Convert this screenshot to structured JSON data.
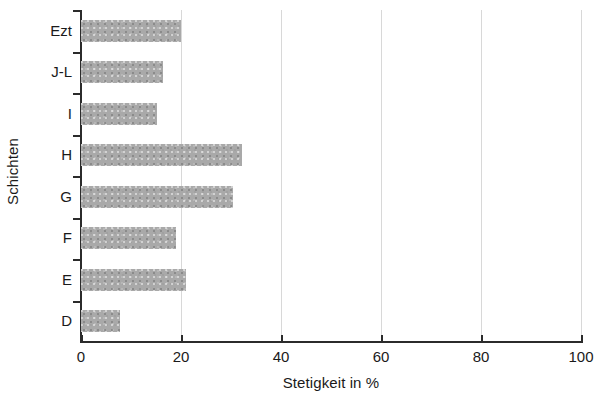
{
  "chart_data": {
    "type": "bar",
    "orientation": "horizontal",
    "title": "",
    "xlabel": "Stetigkeit in %",
    "ylabel": "Schichten",
    "categories": [
      "D",
      "E",
      "F",
      "G",
      "H",
      "I",
      "J-L",
      "Ezt"
    ],
    "values": [
      7.8,
      21,
      19,
      30.4,
      32.2,
      15.2,
      16.4,
      20
    ],
    "xlim": [
      0,
      100
    ],
    "xticks": [
      0,
      20,
      40,
      60,
      80,
      100
    ],
    "xtick_labels": [
      "0",
      "20",
      "40",
      "60",
      "80",
      "100"
    ],
    "grid": "vertical",
    "legend": null,
    "bar_color": "#a9a9a9",
    "axis_color": "#2b2b2b",
    "gridline_color": "#d8d8d8",
    "background_color": "#ffffff"
  }
}
